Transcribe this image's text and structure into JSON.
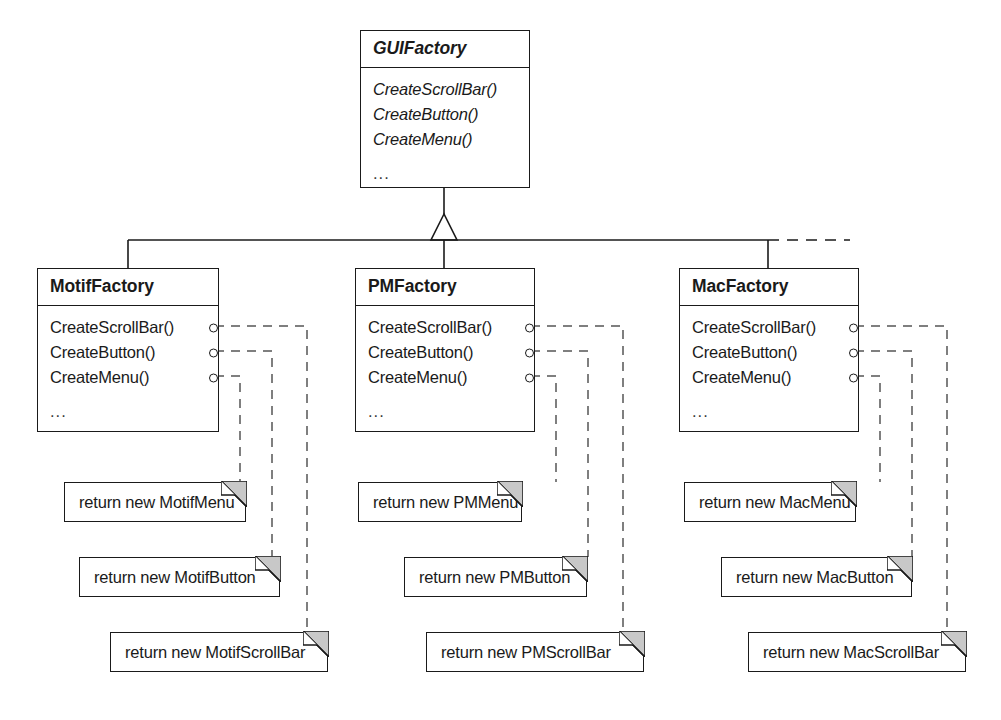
{
  "diagram": {
    "type": "uml-class-diagram",
    "colors": {
      "background": "#ffffff",
      "stroke": "#1a1a1a",
      "note_fold_fill": "#c8c8c8"
    }
  },
  "abstract_class": {
    "name": "GUIFactory",
    "is_abstract": true,
    "operations": [
      "CreateScrollBar()",
      "CreateButton()",
      "CreateMenu()"
    ],
    "ellipsis": "..."
  },
  "subclasses": [
    {
      "name": "MotifFactory",
      "is_abstract": false,
      "operations": [
        "CreateScrollBar()",
        "CreateButton()",
        "CreateMenu()"
      ],
      "ellipsis": "..."
    },
    {
      "name": "PMFactory",
      "is_abstract": false,
      "operations": [
        "CreateScrollBar()",
        "CreateButton()",
        "CreateMenu()"
      ],
      "ellipsis": "..."
    },
    {
      "name": "MacFactory",
      "is_abstract": false,
      "operations": [
        "CreateScrollBar()",
        "CreateButton()",
        "CreateMenu()"
      ],
      "ellipsis": "..."
    }
  ],
  "notes": [
    {
      "id": "motif-menu",
      "text": "return new MotifMenu"
    },
    {
      "id": "motif-button",
      "text": "return new MotifButton"
    },
    {
      "id": "motif-scrollbar",
      "text": "return new MotifScrollBar"
    },
    {
      "id": "pm-menu",
      "text": "return new PMMenu"
    },
    {
      "id": "pm-button",
      "text": "return new PMButton"
    },
    {
      "id": "pm-scrollbar",
      "text": "return new PMScrollBar"
    },
    {
      "id": "mac-menu",
      "text": "return new MacMenu"
    },
    {
      "id": "mac-button",
      "text": "return new MacButton"
    },
    {
      "id": "mac-scrollbar",
      "text": "return new MacScrollBar"
    }
  ]
}
